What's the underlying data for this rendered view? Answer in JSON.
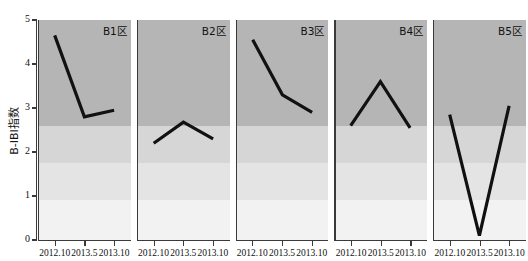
{
  "chart_data": {
    "type": "line",
    "title": "",
    "xlabel": "",
    "ylabel": "B-IBI指数",
    "ylim": [
      0,
      5
    ],
    "yticks": [
      0,
      1,
      2,
      3,
      4,
      5
    ],
    "ytick_labels": [
      "0",
      "1",
      "2",
      "3",
      "4",
      "5"
    ],
    "x": [
      "2012.10",
      "2013.5",
      "2013.10"
    ],
    "categories": [
      "2012.10",
      "2013.5",
      "2013.10"
    ],
    "grid": false,
    "legend": "none",
    "panel_layout": "1x5 small multiples, shared y-axis",
    "line_color": "#111111",
    "line_width_px": 3.2,
    "background_bands": [
      {
        "label": "band-lowest",
        "from": 0.0,
        "to": 0.9,
        "color": "#f2f2f2"
      },
      {
        "label": "band-low",
        "from": 0.9,
        "to": 1.75,
        "color": "#e4e4e4"
      },
      {
        "label": "band-mid",
        "from": 1.75,
        "to": 2.6,
        "color": "#d6d6d6"
      },
      {
        "label": "band-high",
        "from": 2.6,
        "to": 5.0,
        "color": "#b5b5b5"
      }
    ],
    "panels": [
      {
        "name": "B1区",
        "values": [
          4.65,
          2.8,
          2.95
        ]
      },
      {
        "name": "B2区",
        "values": [
          2.2,
          2.68,
          2.3
        ]
      },
      {
        "name": "B3区",
        "values": [
          4.55,
          3.3,
          2.9
        ]
      },
      {
        "name": "B4区",
        "values": [
          2.6,
          3.6,
          2.55
        ]
      },
      {
        "name": "B5区",
        "values": [
          2.85,
          0.1,
          3.05
        ]
      }
    ]
  }
}
